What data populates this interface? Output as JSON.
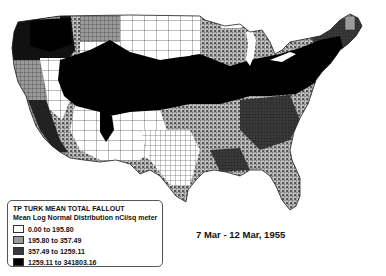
{
  "map": {
    "subject": "United States county choropleth",
    "date_range": "7 Mar - 12 Mar, 1955"
  },
  "legend": {
    "title": "TP TURK MEAN TOTAL FALLOUT",
    "subtitle": "Mean Log Normal Distribution nCi/sq meter",
    "classes": [
      {
        "label": "0.00 to 195.80",
        "color": "#ffffff"
      },
      {
        "label": "195.80 to 357.49",
        "color": "#9a9a9a"
      },
      {
        "label": "357.49 to 1259.11",
        "color": "#3a3a3a"
      },
      {
        "label": "1259.11 to 341803.16",
        "color": "#000000"
      }
    ]
  },
  "colors": {
    "class0": "#ffffff",
    "class1": "#9a9a9a",
    "class2": "#3a3a3a",
    "class3": "#000000",
    "county_border": "#222222"
  }
}
